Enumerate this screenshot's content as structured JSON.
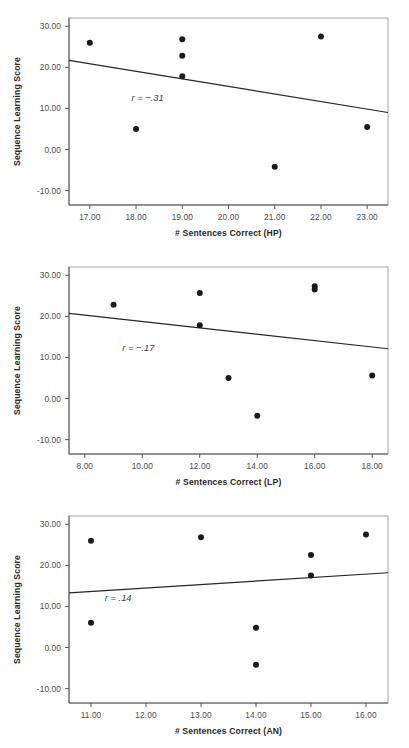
{
  "figure": {
    "background": "#ffffff",
    "point_color": "#1a1a1a",
    "line_color": "#262626",
    "axis_color": "#555555"
  },
  "panels": [
    {
      "id": "panel-hp",
      "ylabel": "Sequence Learning Score",
      "xlabel": "# Sentences Correct (HP)",
      "annotation": "r = −.31",
      "yticks": [
        "30.00",
        "20.00",
        "10.00",
        "0.00",
        "-10.00"
      ],
      "xticks": [
        "17.00",
        "18.00",
        "19.00",
        "20.00",
        "21.00",
        "22.00",
        "23.00"
      ]
    },
    {
      "id": "panel-lp",
      "ylabel": "Sequence Learning Score",
      "xlabel": "# Sentences Correct (LP)",
      "annotation": "r = −.17",
      "yticks": [
        "30.00",
        "20.00",
        "10.00",
        "0.00",
        "-10.00"
      ],
      "xticks": [
        "8.00",
        "10.00",
        "12.00",
        "14.00",
        "16.00",
        "18.00"
      ]
    },
    {
      "id": "panel-an",
      "ylabel": "Sequence Learning Score",
      "xlabel": "# Sentences Correct (AN)",
      "annotation": "r = .14",
      "yticks": [
        "30.00",
        "20.00",
        "10.00",
        "0.00",
        "-10.00"
      ],
      "xticks": [
        "11.00",
        "12.00",
        "13.00",
        "14.00",
        "15.00",
        "16.00"
      ]
    }
  ],
  "chart_data": [
    {
      "type": "scatter",
      "title": "",
      "xlabel": "# Sentences Correct (HP)",
      "ylabel": "Sequence Learning Score",
      "xlim": [
        16.55,
        23.45
      ],
      "ylim": [
        -13.5,
        32.0
      ],
      "xticks": [
        17,
        18,
        19,
        20,
        21,
        22,
        23
      ],
      "yticks": [
        30,
        20,
        10,
        0,
        -10
      ],
      "grid": false,
      "legend": null,
      "annotations": [
        {
          "text": "r = −.31",
          "x": 17.9,
          "y": 11.8
        }
      ],
      "correlation": -0.31,
      "points": [
        {
          "x": 17,
          "y": 26.0
        },
        {
          "x": 18,
          "y": 5.0
        },
        {
          "x": 19,
          "y": 26.8
        },
        {
          "x": 19,
          "y": 22.8
        },
        {
          "x": 19,
          "y": 17.8
        },
        {
          "x": 21,
          "y": -4.2
        },
        {
          "x": 22,
          "y": 27.5
        },
        {
          "x": 23,
          "y": 5.5
        }
      ],
      "fit_line": {
        "x0": 16.55,
        "y0": 21.7,
        "x1": 23.45,
        "y1": 9.0
      }
    },
    {
      "type": "scatter",
      "title": "",
      "xlabel": "# Sentences Correct (LP)",
      "ylabel": "Sequence Learning Score",
      "xlim": [
        7.45,
        18.55
      ],
      "ylim": [
        -13.5,
        32.0
      ],
      "xticks": [
        8,
        10,
        12,
        14,
        16,
        18
      ],
      "yticks": [
        30,
        20,
        10,
        0,
        -10
      ],
      "grid": false,
      "legend": null,
      "annotations": [
        {
          "text": "r = −.17",
          "x": 9.3,
          "y": 11.5
        }
      ],
      "correlation": -0.17,
      "points": [
        {
          "x": 9,
          "y": 22.8
        },
        {
          "x": 12,
          "y": 25.7
        },
        {
          "x": 12,
          "y": 17.8
        },
        {
          "x": 13,
          "y": 5.0
        },
        {
          "x": 14,
          "y": -4.2
        },
        {
          "x": 16,
          "y": 27.3
        },
        {
          "x": 16,
          "y": 26.5
        },
        {
          "x": 18,
          "y": 5.6
        }
      ],
      "fit_line": {
        "x0": 7.45,
        "y0": 20.7,
        "x1": 18.55,
        "y1": 12.1
      }
    },
    {
      "type": "scatter",
      "title": "",
      "xlabel": "# Sentences Correct (AN)",
      "ylabel": "Sequence Learning Score",
      "xlim": [
        10.6,
        16.4
      ],
      "ylim": [
        -13.5,
        32.0
      ],
      "xticks": [
        11,
        12,
        13,
        14,
        15,
        16
      ],
      "yticks": [
        30,
        20,
        10,
        0,
        -10
      ],
      "grid": false,
      "legend": null,
      "annotations": [
        {
          "text": "r = .14",
          "x": 11.25,
          "y": 11.2
        }
      ],
      "correlation": 0.14,
      "points": [
        {
          "x": 11,
          "y": 26.0
        },
        {
          "x": 11,
          "y": 6.0
        },
        {
          "x": 13,
          "y": 26.8
        },
        {
          "x": 14,
          "y": 4.8
        },
        {
          "x": 14,
          "y": -4.2
        },
        {
          "x": 15,
          "y": 22.5
        },
        {
          "x": 15,
          "y": 17.5
        },
        {
          "x": 16,
          "y": 27.5
        }
      ],
      "fit_line": {
        "x0": 10.6,
        "y0": 13.3,
        "x1": 16.4,
        "y1": 18.2
      }
    }
  ]
}
